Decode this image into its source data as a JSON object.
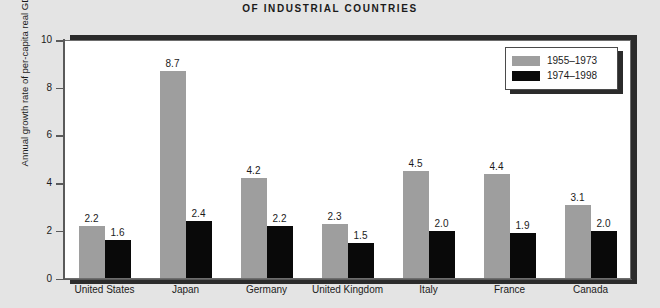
{
  "chart_data": {
    "type": "bar",
    "title": "OF INDUSTRIAL COUNTRIES",
    "xlabel": "",
    "ylabel": "Annual growth rate of per-capita real GDP",
    "ylim": [
      0,
      10
    ],
    "yticks": [
      "0",
      "2",
      "4",
      "6",
      "8",
      "10"
    ],
    "grid": false,
    "legend_position": "top-right",
    "categories": [
      "United States",
      "Japan",
      "Germany",
      "United Kingdom",
      "Italy",
      "France",
      "Canada"
    ],
    "series": [
      {
        "name": "1955-1973",
        "color": "#9e9e9e",
        "values": [
          2.2,
          8.7,
          4.2,
          2.3,
          4.5,
          4.4,
          3.1
        ],
        "labels": [
          "2.2",
          "8.7",
          "4.2",
          "2.3",
          "4.5",
          "4.4",
          "3.1"
        ]
      },
      {
        "name": "1974-1998",
        "color": "#090909",
        "values": [
          1.6,
          2.4,
          2.2,
          1.5,
          2.0,
          1.9,
          2.0
        ],
        "labels": [
          "1.6",
          "2.4",
          "2.2",
          "1.5",
          "2.0",
          "1.9",
          "2.0"
        ]
      }
    ]
  },
  "legend": {
    "entries": [
      {
        "label": "1955–1973",
        "swatch": "gray"
      },
      {
        "label": "1974–1998",
        "swatch": "black"
      }
    ]
  }
}
